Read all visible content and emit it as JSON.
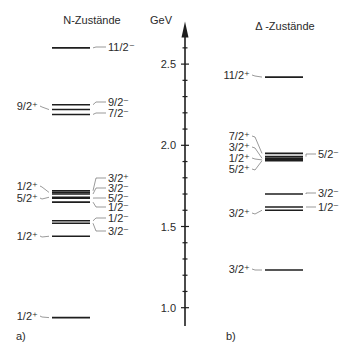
{
  "titles": {
    "n_states": "N-Zustände",
    "delta_states": "Δ -Zustände",
    "unit": "GeV",
    "panel_a": "a)",
    "panel_b": "b)"
  },
  "axis": {
    "unit": "GeV",
    "min": 0.9,
    "max": 2.75,
    "major_ticks": [
      1.0,
      1.5,
      2.0,
      2.5
    ],
    "major_labels": [
      "1.0",
      "1.5",
      "2.0",
      "2.5"
    ],
    "minor_step": 0.1,
    "px_per_gev": 162.4,
    "y_at_1gev": 307.7
  },
  "n_levels": [
    {
      "E": 0.939,
      "jp": "1/2⁺",
      "side": "left",
      "label_y": 316
    },
    {
      "E": 1.44,
      "jp": "1/2⁺",
      "side": "left",
      "label_y": 236
    },
    {
      "E": 1.52,
      "jp": "3/2⁻",
      "side": "right",
      "label_y": 231
    },
    {
      "E": 1.535,
      "jp": "1/2⁻",
      "side": "right",
      "label_y": 218
    },
    {
      "E": 1.65,
      "jp": "1/2⁻",
      "side": "right",
      "label_y": 207
    },
    {
      "E": 1.675,
      "jp": "5/2⁻",
      "side": "right",
      "label_y": 198
    },
    {
      "E": 1.68,
      "jp": "5/2⁺",
      "side": "left",
      "label_y": 198
    },
    {
      "E": 1.7,
      "jp": "3/2⁻",
      "side": "right",
      "label_y": 188
    },
    {
      "E": 1.71,
      "jp": "1/2⁺",
      "side": "left",
      "label_y": 186
    },
    {
      "E": 1.72,
      "jp": "3/2⁺",
      "side": "right",
      "label_y": 178
    },
    {
      "E": 2.19,
      "jp": "7/2⁻",
      "side": "right",
      "label_y": 113
    },
    {
      "E": 2.22,
      "jp": "9/2⁺",
      "side": "left",
      "label_y": 106
    },
    {
      "E": 2.25,
      "jp": "9/2⁻",
      "side": "right",
      "label_y": 102
    },
    {
      "E": 2.6,
      "jp": "11/2⁻",
      "side": "right",
      "label_y": 47
    }
  ],
  "delta_levels": [
    {
      "E": 1.232,
      "jp": "3/2⁺",
      "side": "left",
      "label_y": 269
    },
    {
      "E": 1.6,
      "jp": "3/2⁺",
      "side": "left",
      "label_y": 213
    },
    {
      "E": 1.62,
      "jp": "1/2⁻",
      "side": "right",
      "label_y": 207
    },
    {
      "E": 1.7,
      "jp": "3/2⁻",
      "side": "right",
      "label_y": 193
    },
    {
      "E": 1.905,
      "jp": "5/2⁺",
      "side": "left",
      "label_y": 169
    },
    {
      "E": 1.91,
      "jp": "1/2⁺",
      "side": "left",
      "label_y": 158
    },
    {
      "E": 1.92,
      "jp": "3/2⁺",
      "side": "left",
      "label_y": 147
    },
    {
      "E": 1.93,
      "jp": "5/2⁻",
      "side": "right",
      "label_y": 154
    },
    {
      "E": 1.95,
      "jp": "7/2⁺",
      "side": "left",
      "label_y": 136
    },
    {
      "E": 2.42,
      "jp": "11/2⁺",
      "side": "left",
      "label_y": 75
    }
  ]
}
